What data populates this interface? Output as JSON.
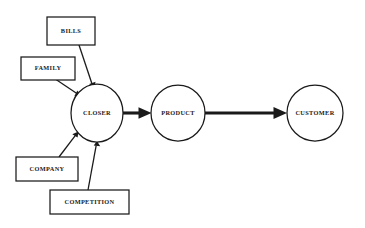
{
  "diagram": {
    "type": "flow-diagram",
    "background_color": "#ffffff",
    "stroke_color": "#1a1a1a",
    "title": "",
    "ellipse_nodes": [
      {
        "id": "closer",
        "label": "CLOSER",
        "cx": 97,
        "cy": 113,
        "rx": 26,
        "ry": 29
      },
      {
        "id": "product",
        "label": "PRODUCT",
        "cx": 178,
        "cy": 113,
        "rx": 27,
        "ry": 28
      },
      {
        "id": "customer",
        "label": "CUSTOMER",
        "cx": 315,
        "cy": 113,
        "rx": 28,
        "ry": 28
      }
    ],
    "box_nodes": [
      {
        "id": "bills",
        "label": "BILLS",
        "x": 47,
        "y": 17,
        "w": 48,
        "h": 28
      },
      {
        "id": "family",
        "label": "FAMILY",
        "x": 21,
        "y": 57,
        "w": 54,
        "h": 23
      },
      {
        "id": "company",
        "label": "COMPANY",
        "x": 16,
        "y": 157,
        "w": 62,
        "h": 24
      },
      {
        "id": "competition",
        "label": "COMPETITION",
        "x": 50,
        "y": 190,
        "w": 79,
        "h": 24
      }
    ],
    "connectors": [
      {
        "id": "bills-to-closer",
        "from": "bills",
        "to": "closer",
        "weight": "thin"
      },
      {
        "id": "family-to-closer",
        "from": "family",
        "to": "closer",
        "weight": "thin"
      },
      {
        "id": "company-to-closer",
        "from": "company",
        "to": "closer",
        "weight": "thin"
      },
      {
        "id": "competition-to-closer",
        "from": "competition",
        "to": "closer",
        "weight": "thin"
      },
      {
        "id": "closer-to-product",
        "from": "closer",
        "to": "product",
        "weight": "thick"
      },
      {
        "id": "product-to-customer",
        "from": "product",
        "to": "customer",
        "weight": "thick"
      }
    ]
  }
}
